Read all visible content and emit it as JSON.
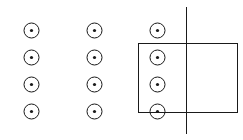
{
  "diagram": {
    "field": {
      "symbol": "out-of-page",
      "rows": 4,
      "columns": 3
    },
    "loop": {
      "shape": "rectangle"
    },
    "boundary": {
      "orientation": "vertical"
    },
    "colors": {
      "stroke": "#1a1a1a",
      "background": "#ffffff"
    }
  }
}
